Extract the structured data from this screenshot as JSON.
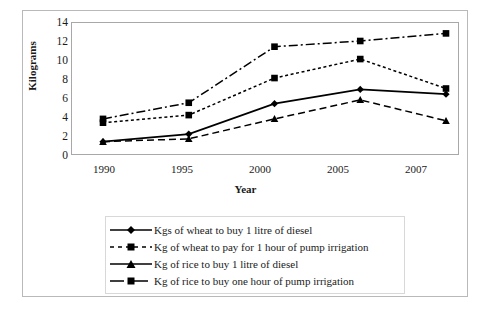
{
  "chart_data": {
    "type": "line",
    "title": "",
    "xlabel": "Year",
    "ylabel": "Kilograms",
    "categories": [
      "1990",
      "1995",
      "2000",
      "2005",
      "2007"
    ],
    "x": [
      1990,
      1995,
      2000,
      2005,
      2007
    ],
    "ylim": [
      0,
      14
    ],
    "yticks": [
      0,
      2,
      4,
      6,
      8,
      10,
      12,
      14
    ],
    "grid": false,
    "legend_position": "bottom",
    "series": [
      {
        "name": "Kgs of wheat to buy 1 litre of diesel",
        "marker": "diamond",
        "line": "solid",
        "color": "#000000",
        "values": [
          1.4,
          2.2,
          5.4,
          6.9,
          6.4
        ]
      },
      {
        "name": "Kg of wheat to pay for 1 hour of pump irrigation",
        "marker": "square",
        "line": "dotted",
        "color": "#000000",
        "values": [
          3.4,
          4.2,
          8.1,
          10.1,
          7.0
        ]
      },
      {
        "name": "Kg of rice to buy 1 litre of diesel",
        "marker": "triangle",
        "line": "dashed",
        "color": "#000000",
        "values": [
          1.4,
          1.7,
          3.8,
          5.8,
          3.6
        ]
      },
      {
        "name": "Kg of rice to buy one hour of pump irrigation",
        "marker": "square",
        "line": "dash-dot",
        "color": "#000000",
        "values": [
          3.8,
          5.5,
          11.4,
          12.0,
          12.8
        ]
      }
    ]
  },
  "axes": {
    "ylabel": "Kilograms",
    "xlabel": "Year",
    "yticks": [
      "14",
      "12",
      "10",
      "8",
      "6",
      "4",
      "2",
      "0"
    ],
    "xticks": [
      "1990",
      "1995",
      "2000",
      "2005",
      "2007"
    ]
  },
  "legend": {
    "items": [
      {
        "label": "Kgs of wheat to buy 1 litre of diesel"
      },
      {
        "label": "Kg of wheat to pay for 1 hour of pump irrigation"
      },
      {
        "label": "Kg of rice to buy 1 litre of diesel"
      },
      {
        "label": "Kg of rice to buy one hour of pump irrigation"
      }
    ]
  }
}
